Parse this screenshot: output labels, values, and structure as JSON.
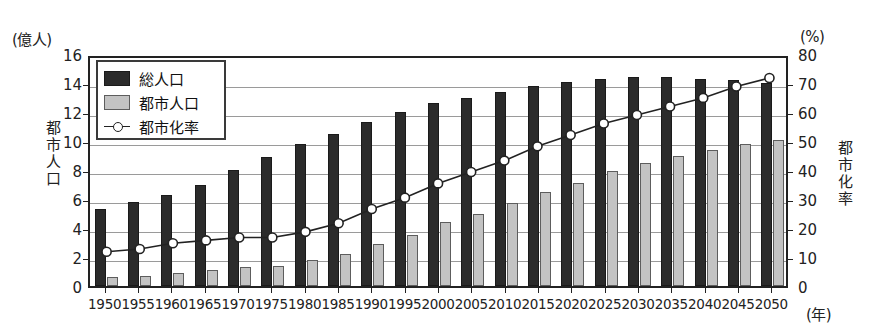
{
  "chart_data": {
    "type": "bar",
    "title": "",
    "xlabel": "(年)",
    "ylabel": "都市人口",
    "y2label": "都市化率",
    "yunit": "(億人)",
    "y2unit": "(%)",
    "ylim": [
      0,
      16
    ],
    "y2lim": [
      0,
      80
    ],
    "yticks": [
      0,
      2,
      4,
      6,
      8,
      10,
      12,
      14,
      16
    ],
    "y2ticks": [
      0,
      10,
      20,
      30,
      40,
      50,
      60,
      70,
      80
    ],
    "grid": true,
    "legend_position": "upper-left",
    "categories": [
      "1950",
      "1955",
      "1960",
      "1965",
      "1970",
      "1975",
      "1980",
      "1985",
      "1990",
      "1995",
      "2000",
      "2005",
      "2010",
      "2015",
      "2020",
      "2025",
      "2030",
      "2035",
      "2040",
      "2045",
      "2050"
    ],
    "series": [
      {
        "name": "総人口",
        "kind": "bar",
        "color": "#2b2b2b",
        "axis": "left",
        "unit": "億人",
        "values": [
          5.3,
          5.8,
          6.3,
          7.0,
          8.0,
          8.9,
          9.8,
          10.5,
          11.3,
          12.0,
          12.6,
          13.0,
          13.4,
          13.8,
          14.1,
          14.3,
          14.4,
          14.4,
          14.3,
          14.2,
          14.0
        ]
      },
      {
        "name": "都市人口",
        "kind": "bar",
        "color": "#c3c3c3",
        "axis": "left",
        "unit": "億人",
        "values": [
          0.6,
          0.7,
          0.9,
          1.1,
          1.3,
          1.4,
          1.8,
          2.2,
          2.9,
          3.5,
          4.4,
          5.0,
          5.7,
          6.5,
          7.1,
          7.9,
          8.5,
          9.0,
          9.4,
          9.8,
          10.1
        ]
      },
      {
        "name": "都市化率",
        "kind": "line",
        "color": "#222222",
        "axis": "right",
        "unit": "%",
        "values": [
          12,
          13,
          15,
          16,
          17,
          17,
          19,
          22,
          27,
          31,
          36,
          40,
          44,
          49,
          53,
          57,
          60,
          63,
          66,
          70,
          73
        ]
      }
    ]
  },
  "legend": {
    "items": [
      {
        "label": "総人口",
        "swatch": "black-box"
      },
      {
        "label": "都市人口",
        "swatch": "gray-box"
      },
      {
        "label": "都市化率",
        "swatch": "line-marker"
      }
    ]
  }
}
